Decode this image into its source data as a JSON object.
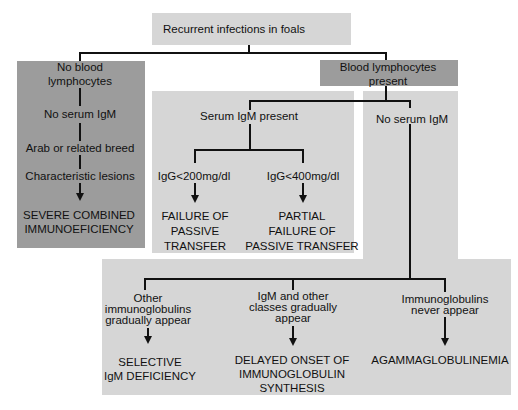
{
  "diagram": {
    "root": "Recurrent infections in foals",
    "left_branch": {
      "header": [
        "No blood",
        "lymphocytes"
      ],
      "steps": [
        "No serum IgM",
        "Arab or related breed",
        "Characteristic lesions"
      ],
      "outcome": [
        "SEVERE COMBINED",
        "IMMUNOEFICIENCY"
      ]
    },
    "right_branch": {
      "header": [
        "Blood lymphocytes",
        "present"
      ],
      "serum_igm_present": {
        "label": "Serum IgM present",
        "options": [
          {
            "condition": "IgG<200mg/dl",
            "outcome": [
              "FAILURE OF",
              "PASSIVE",
              "TRANSFER"
            ]
          },
          {
            "condition": "IgG<400mg/dl",
            "outcome": [
              "PARTIAL",
              "FAILURE OF",
              "PASSIVE TRANSFER"
            ]
          }
        ]
      },
      "no_serum_igm": {
        "label": "No serum IgM",
        "options": [
          {
            "condition": [
              "Other",
              "immunoglobulins",
              "gradually appear"
            ],
            "outcome": [
              "SELECTIVE",
              "IgM DEFICIENCY"
            ]
          },
          {
            "condition": [
              "IgM and other",
              "classes gradually",
              "appear"
            ],
            "outcome": [
              "DELAYED ONSET OF",
              "IMMUNOGLOBULIN",
              "SYNTHESIS"
            ]
          },
          {
            "condition": [
              "Immunoglobulins",
              "never appear"
            ],
            "outcome": [
              "AGAMMAGLOBULINEMIA"
            ]
          }
        ]
      }
    }
  },
  "colors": {
    "light_box": "#d6d6d6",
    "dark_box": "#9c9c9c",
    "line": "#111111"
  }
}
